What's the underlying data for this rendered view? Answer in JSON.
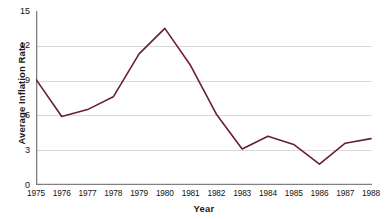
{
  "chart_data": {
    "type": "line",
    "title": "",
    "xlabel": "Year",
    "ylabel": "Average Inflation Rate",
    "categories": [
      "1975",
      "1976",
      "1977",
      "1978",
      "1979",
      "1980",
      "1981",
      "1982",
      "1983",
      "1984",
      "1985",
      "1986",
      "1987",
      "1988"
    ],
    "values": [
      9.1,
      5.9,
      6.5,
      7.6,
      11.3,
      13.5,
      10.3,
      6.1,
      3.1,
      4.2,
      3.5,
      1.8,
      3.6,
      4.0
    ],
    "series": [
      {
        "name": "Average Inflation Rate",
        "color": "#6b1f33",
        "values": [
          9.1,
          5.9,
          6.5,
          7.6,
          11.3,
          13.5,
          10.3,
          6.1,
          3.1,
          4.2,
          3.5,
          1.8,
          3.6,
          4.0
        ]
      }
    ],
    "xlim": [
      1975,
      1988
    ],
    "ylim": [
      0,
      15
    ],
    "yticks": [
      0,
      3,
      6,
      9,
      12,
      15
    ],
    "ytick_labels": [
      "0",
      "3",
      "6",
      "9",
      "12",
      "15"
    ],
    "xticks": [
      1975,
      1976,
      1977,
      1978,
      1979,
      1980,
      1981,
      1982,
      1983,
      1984,
      1985,
      1986,
      1987,
      1988
    ],
    "grid": "horizontal",
    "gridline_values": [
      3,
      6,
      9,
      12
    ],
    "legend": "none",
    "colors": {
      "line": "#6b1f33",
      "gridline": "#d9d9d9",
      "axis": "#808080",
      "background": "#ffffff",
      "text": "#111111"
    }
  }
}
